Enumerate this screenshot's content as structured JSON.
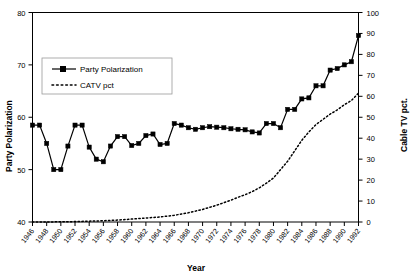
{
  "chart_data": {
    "type": "line",
    "title": "",
    "xlabel": "Year",
    "ylabel": "Party Polarization",
    "y2label": "Cable TV pct.",
    "grid": false,
    "legend_position": "upper-left-inside",
    "ylim": [
      40,
      80
    ],
    "y2lim": [
      0,
      100
    ],
    "yticks": [
      40,
      50,
      60,
      70,
      80
    ],
    "y2ticks": [
      0,
      10,
      20,
      30,
      40,
      50,
      60,
      70,
      80,
      90,
      100
    ],
    "x": [
      1946,
      1948,
      1950,
      1952,
      1954,
      1956,
      1958,
      1960,
      1962,
      1964,
      1966,
      1968,
      1970,
      1972,
      1974,
      1976,
      1978,
      1980,
      1982,
      1984,
      1986,
      1988,
      1990,
      1992
    ],
    "xticklabels": [
      "1946",
      "1948",
      "1950",
      "1952",
      "1954",
      "1956",
      "1958",
      "1960",
      "1962",
      "1964",
      "1966",
      "1968",
      "1970",
      "1972",
      "1974",
      "1976",
      "1978",
      "1980",
      "1982",
      "1984",
      "1986",
      "1988",
      "1990",
      "1992"
    ],
    "series": [
      {
        "name": "Party Polarization",
        "axis": "left",
        "style": "solid-with-square-markers",
        "x": [
          1946,
          1947,
          1948,
          1949,
          1950,
          1951,
          1952,
          1953,
          1954,
          1955,
          1956,
          1957,
          1958,
          1959,
          1960,
          1961,
          1962,
          1963,
          1964,
          1965,
          1966,
          1967,
          1968,
          1969,
          1970,
          1971,
          1972,
          1973,
          1974,
          1975,
          1976,
          1977,
          1978,
          1979,
          1980,
          1981,
          1982,
          1983,
          1984,
          1985,
          1986,
          1987,
          1988,
          1989,
          1990,
          1991,
          1992
        ],
        "values": [
          58.5,
          58.5,
          55.0,
          50.0,
          50.0,
          54.5,
          58.5,
          58.5,
          54.3,
          52.0,
          51.5,
          54.5,
          56.3,
          56.3,
          54.6,
          55.0,
          56.5,
          56.8,
          54.8,
          55.0,
          58.8,
          58.5,
          58.0,
          57.7,
          58.0,
          58.2,
          58.1,
          58.0,
          57.8,
          57.7,
          57.6,
          57.2,
          57.0,
          58.8,
          58.8,
          58.0,
          61.5,
          61.5,
          63.5,
          63.7,
          66.0,
          66.0,
          69.0,
          69.3,
          70.0,
          70.6,
          75.6
        ]
      },
      {
        "name": "CATV pct",
        "axis": "right",
        "style": "dotted",
        "x": [
          1946,
          1948,
          1950,
          1952,
          1954,
          1956,
          1958,
          1960,
          1962,
          1964,
          1965,
          1966,
          1967,
          1968,
          1969,
          1970,
          1971,
          1972,
          1973,
          1974,
          1975,
          1976,
          1977,
          1978,
          1979,
          1980,
          1981,
          1982,
          1983,
          1984,
          1985,
          1986,
          1987,
          1988,
          1989,
          1990,
          1991,
          1992
        ],
        "values": [
          0.0,
          0.0,
          0.1,
          0.2,
          0.4,
          0.6,
          0.9,
          1.4,
          1.9,
          2.4,
          2.8,
          3.2,
          3.8,
          4.4,
          5.2,
          6.0,
          7.0,
          8.0,
          9.2,
          10.4,
          11.8,
          13.0,
          14.5,
          16.3,
          18.5,
          21.0,
          25.0,
          29.0,
          34.0,
          39.0,
          43.0,
          46.5,
          49.0,
          51.5,
          53.5,
          56.0,
          58.0,
          61.5
        ]
      }
    ]
  },
  "legend": {
    "items": [
      {
        "label": "Party Polarization",
        "marker": "solid-line-square"
      },
      {
        "label": "CATV pct",
        "marker": "dotted-line"
      }
    ]
  }
}
